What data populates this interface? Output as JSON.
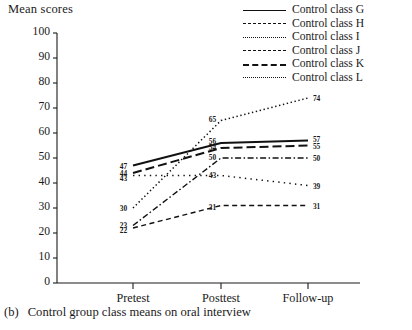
{
  "chart_data": {
    "type": "line",
    "title": "",
    "xlabel": "",
    "ylabel": "Mean scores",
    "categories": [
      "Pretest",
      "Posttest",
      "Follow-up"
    ],
    "ylim": [
      0,
      100
    ],
    "yticks": [
      0,
      10,
      20,
      30,
      40,
      50,
      60,
      70,
      80,
      90,
      100
    ],
    "grid": false,
    "legend_position": "top-right",
    "series": [
      {
        "name": "Control class G",
        "style": "solid",
        "values": [
          47,
          56,
          57
        ]
      },
      {
        "name": "Control class H",
        "style": "dashed",
        "values": [
          22,
          31,
          31
        ]
      },
      {
        "name": "Control class I",
        "style": "dotted",
        "values": [
          30,
          65,
          74
        ]
      },
      {
        "name": "Control class J",
        "style": "dashdot",
        "values": [
          23,
          50,
          50
        ]
      },
      {
        "name": "Control class K",
        "style": "longdash",
        "values": [
          44,
          54,
          55
        ]
      },
      {
        "name": "Control class L",
        "style": "sparse",
        "values": [
          43,
          43,
          39
        ]
      }
    ]
  },
  "axis": {
    "y_title": "Mean scores",
    "y_ticks": [
      "100",
      "90",
      "80",
      "70",
      "60",
      "50",
      "40",
      "30",
      "20",
      "10",
      "0"
    ],
    "x_ticks": [
      "Pretest",
      "Posttest",
      "Follow-up"
    ]
  },
  "legend": {
    "items": [
      {
        "label": "Control class G"
      },
      {
        "label": "Control class H"
      },
      {
        "label": "Control class I"
      },
      {
        "label": "Control class J"
      },
      {
        "label": "Control class K"
      },
      {
        "label": "Control class L"
      }
    ]
  },
  "point_labels": {
    "pretest": [
      "47",
      "44",
      "43",
      "30",
      "23",
      "22"
    ],
    "posttest": [
      "65",
      "56",
      "54",
      "50",
      "43",
      "31"
    ],
    "followup": [
      "74",
      "57",
      "55",
      "50",
      "39",
      "31"
    ]
  },
  "caption": {
    "number": "(b)",
    "text": "Control group class means on oral interview"
  },
  "colors": {
    "ink": "#1a1a1a",
    "axis": "#1a1a1a",
    "background": "#ffffff"
  }
}
